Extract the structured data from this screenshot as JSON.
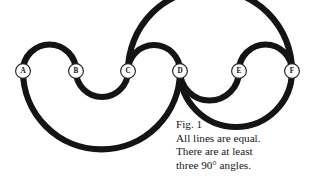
{
  "figure": {
    "background_color": "#ffffff",
    "ink_color": "#141414",
    "width": 317,
    "height": 190
  },
  "nodes": [
    {
      "label": "A",
      "x": 23,
      "y": 71,
      "r": 7.4
    },
    {
      "label": "B",
      "x": 76,
      "y": 71,
      "r": 7.4
    },
    {
      "label": "C",
      "x": 128,
      "y": 71,
      "r": 7.4
    },
    {
      "label": "D",
      "x": 180,
      "y": 71,
      "r": 7.4
    },
    {
      "label": "E",
      "x": 239,
      "y": 71,
      "r": 7.4
    },
    {
      "label": "F",
      "x": 292,
      "y": 71,
      "r": 7.4
    }
  ],
  "arcs": [
    {
      "name": "arc-a-b-above",
      "from": "A",
      "to": "B",
      "side": "above"
    },
    {
      "name": "arc-b-c-below",
      "from": "B",
      "to": "C",
      "side": "below"
    },
    {
      "name": "arc-c-d-above",
      "from": "C",
      "to": "D",
      "side": "above"
    },
    {
      "name": "arc-c-f-above",
      "from": "C",
      "to": "F",
      "side": "above"
    },
    {
      "name": "arc-e-f-above",
      "from": "E",
      "to": "F",
      "side": "above"
    },
    {
      "name": "arc-a-d-below",
      "from": "A",
      "to": "D",
      "side": "below"
    },
    {
      "name": "arc-d-e-below",
      "from": "D",
      "to": "E",
      "side": "below"
    },
    {
      "name": "arc-d-f-below",
      "from": "D",
      "to": "F",
      "side": "below"
    }
  ],
  "caption": {
    "fig_number": "Fig. 1",
    "line1": "All lines are equal.",
    "line2": "There are at least",
    "line3": "three 90° angles."
  }
}
